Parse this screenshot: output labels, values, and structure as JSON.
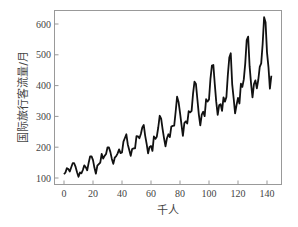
{
  "chart_data": {
    "type": "line",
    "title": "",
    "xlabel": "千人",
    "ylabel": "国际旅行客流量/月",
    "xlim": [
      -4,
      150
    ],
    "ylim": [
      80,
      650
    ],
    "grid": false,
    "legend": null,
    "xticks": [
      0,
      20,
      40,
      60,
      80,
      100,
      120,
      140
    ],
    "yticks": [
      100,
      200,
      300,
      400,
      500,
      600
    ],
    "series": [
      {
        "name": "passengers",
        "color": "#111111",
        "x_start": 0,
        "values": [
          112,
          118,
          132,
          129,
          121,
          135,
          148,
          148,
          136,
          119,
          104,
          118,
          115,
          126,
          141,
          135,
          125,
          149,
          170,
          170,
          158,
          133,
          114,
          140,
          145,
          150,
          178,
          163,
          172,
          178,
          199,
          199,
          184,
          162,
          146,
          166,
          171,
          180,
          193,
          181,
          183,
          218,
          230,
          242,
          209,
          191,
          172,
          194,
          196,
          196,
          236,
          235,
          229,
          243,
          264,
          272,
          237,
          211,
          180,
          201,
          204,
          188,
          235,
          227,
          234,
          264,
          302,
          293,
          259,
          229,
          203,
          229,
          242,
          233,
          267,
          269,
          270,
          315,
          364,
          347,
          312,
          274,
          237,
          278,
          284,
          277,
          317,
          313,
          318,
          374,
          413,
          405,
          355,
          306,
          271,
          306,
          315,
          301,
          356,
          348,
          355,
          422,
          465,
          467,
          404,
          347,
          305,
          336,
          340,
          318,
          362,
          348,
          363,
          435,
          491,
          505,
          404,
          359,
          310,
          337,
          360,
          342,
          406,
          396,
          420,
          472,
          548,
          559,
          463,
          407,
          362,
          405,
          417,
          391,
          419,
          461,
          472,
          535,
          622,
          606,
          508,
          461,
          390,
          432
        ]
      }
    ]
  }
}
